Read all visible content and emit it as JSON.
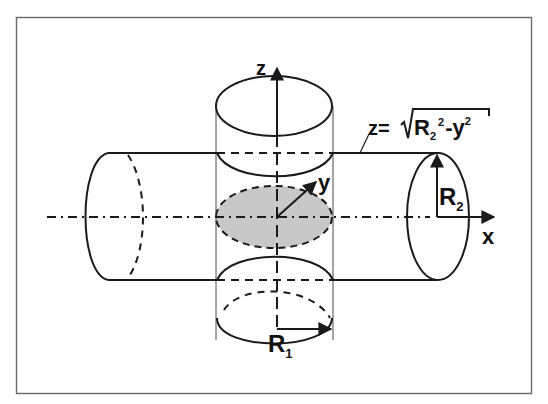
{
  "figure": {
    "type": "intersecting cylinders diagram",
    "colors": {
      "stroke": "#1a1a1a",
      "frame": "#555555",
      "shaded": "#c8c8c8",
      "background": "#ffffff"
    },
    "axes": {
      "z": "z",
      "y": "y",
      "x": "x"
    },
    "labels": {
      "r1": "R",
      "r1_sub": "1",
      "r2": "R",
      "r2_sub": "2",
      "equation_prefix": "z=",
      "equation_r": "R",
      "equation_r_sub": "2",
      "equation_r_sup": "2",
      "equation_rest": "-y",
      "equation_y_sup": "2"
    }
  }
}
